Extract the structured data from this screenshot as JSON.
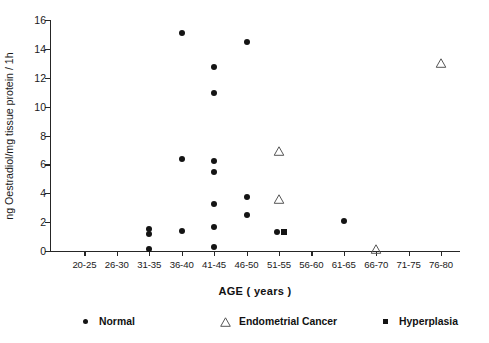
{
  "chart_data": {
    "type": "scatter",
    "title": "",
    "xlabel": "AGE ( years )",
    "ylabel": "ng Oestradiol/mg tissue protein / 1h",
    "categories": [
      "20-25",
      "26-30",
      "31-35",
      "36-40",
      "41-45",
      "46-50",
      "51-55",
      "56-60",
      "61-65",
      "66-70",
      "71-75",
      "76-80"
    ],
    "ylim": [
      0,
      16
    ],
    "yticks": [
      0,
      2,
      4,
      6,
      8,
      10,
      12,
      14,
      16
    ],
    "grid": false,
    "legend_position": "bottom",
    "series": [
      {
        "name": "Normal",
        "marker": "filled-circle",
        "color": "#141414",
        "points": [
          {
            "category": "31-35",
            "value": 1.55
          },
          {
            "category": "31-35",
            "value": 1.15
          },
          {
            "category": "31-35",
            "value": 0.15
          },
          {
            "category": "36-40",
            "value": 15.1
          },
          {
            "category": "36-40",
            "value": 6.4
          },
          {
            "category": "36-40",
            "value": 1.4
          },
          {
            "category": "41-45",
            "value": 12.75
          },
          {
            "category": "41-45",
            "value": 10.95
          },
          {
            "category": "41-45",
            "value": 6.2
          },
          {
            "category": "41-45",
            "value": 5.45
          },
          {
            "category": "41-45",
            "value": 3.25
          },
          {
            "category": "41-45",
            "value": 1.65
          },
          {
            "category": "41-45",
            "value": 0.25
          },
          {
            "category": "46-50",
            "value": 14.5
          },
          {
            "category": "46-50",
            "value": 3.75
          },
          {
            "category": "46-50",
            "value": 2.5
          },
          {
            "category": "51-55",
            "value": 1.35
          },
          {
            "category": "61-65",
            "value": 2.05
          }
        ]
      },
      {
        "name": "Endometrial Cancer",
        "marker": "open-triangle",
        "color": "#555555",
        "points": [
          {
            "category": "51-55",
            "value": 6.9
          },
          {
            "category": "51-55",
            "value": 3.6
          },
          {
            "category": "66-70",
            "value": 0.15
          },
          {
            "category": "76-80",
            "value": 13.0
          }
        ]
      },
      {
        "name": "Hyperplasia",
        "marker": "filled-square",
        "color": "#141414",
        "points": [
          {
            "category": "51-55",
            "value": 1.35
          }
        ]
      }
    ]
  },
  "legend": {
    "items": [
      {
        "label": "Normal",
        "marker": "filled-circle"
      },
      {
        "label": "Endometrial Cancer",
        "marker": "open-triangle"
      },
      {
        "label": "Hyperplasia",
        "marker": "filled-square"
      }
    ]
  }
}
